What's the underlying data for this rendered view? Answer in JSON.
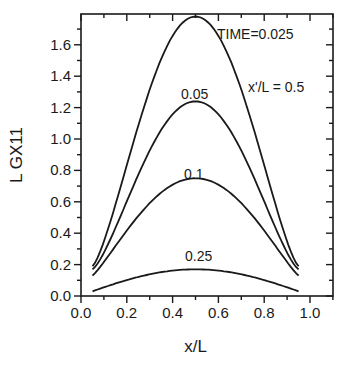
{
  "chart_data": {
    "type": "line",
    "title": "",
    "xlabel": "x/L",
    "ylabel": "L GX11",
    "xlim": [
      0.0,
      1.1
    ],
    "ylim": [
      0.0,
      1.8
    ],
    "xticks": [
      "0.0",
      "0.2",
      "0.4",
      "0.6",
      "0.8",
      "1.0"
    ],
    "yticks": [
      "0.0",
      "0.2",
      "0.4",
      "0.6",
      "0.8",
      "1.0",
      "1.2",
      "1.4",
      "1.6"
    ],
    "grid": false,
    "legend": "none (curves labeled inline)",
    "annotations": [
      "TIME=0.025",
      "0.05",
      "0.1",
      "0.25",
      "x'/L = 0.5"
    ],
    "series": [
      {
        "name": "TIME=0.025",
        "label": "TIME=0.025",
        "x": [
          0.05,
          0.5,
          0.95
        ],
        "endpoint": 0.19,
        "peak": 1.78
      },
      {
        "name": "0.05",
        "label": "0.05",
        "x": [
          0.05,
          0.5,
          0.95
        ],
        "endpoint": 0.17,
        "peak": 1.24
      },
      {
        "name": "0.1",
        "label": "0.1",
        "x": [
          0.05,
          0.5,
          0.95
        ],
        "endpoint": 0.13,
        "peak": 0.75
      },
      {
        "name": "0.25",
        "label": "0.25",
        "x": [
          0.05,
          0.5,
          0.95
        ],
        "endpoint": 0.03,
        "peak": 0.17
      }
    ],
    "parameter_note": "x'/L = 0.5"
  }
}
